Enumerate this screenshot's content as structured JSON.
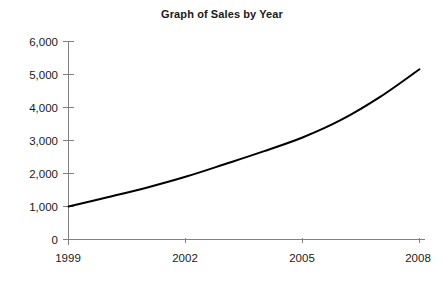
{
  "chart_data": {
    "type": "line",
    "title": "Graph of Sales by Year",
    "xlabel": "",
    "ylabel": "",
    "grid": false,
    "legend": "none",
    "x": [
      1999,
      2000,
      2001,
      2002,
      2003,
      2004,
      2005,
      2006,
      2007,
      2008
    ],
    "values": [
      1000,
      1280,
      1570,
      1900,
      2280,
      2670,
      3090,
      3630,
      4330,
      5160
    ],
    "series": [
      {
        "name": "Sales",
        "values": [
          1000,
          1280,
          1570,
          1900,
          2280,
          2670,
          3090,
          3630,
          4330,
          5160
        ],
        "color": "#000000"
      }
    ],
    "xlim": [
      1999,
      2008
    ],
    "ylim": [
      0,
      6000
    ],
    "xticks": [
      1999,
      2002,
      2005,
      2008
    ],
    "xtick_labels": [
      "1999",
      "2002",
      "2005",
      "2008"
    ],
    "yticks": [
      0,
      1000,
      2000,
      3000,
      4000,
      5000,
      6000
    ],
    "ytick_labels": [
      "0",
      "1,000",
      "2,000",
      "3,000",
      "4,000",
      "5,000",
      "6,000"
    ],
    "axis_color": "#808080",
    "curve_color": "#000000",
    "background_color": "#ffffff"
  },
  "axes": {
    "y_tick_labels": [
      "6,000",
      "5,000",
      "4,000",
      "3,000",
      "2,000",
      "1,000",
      "0"
    ],
    "x_tick_labels": [
      "1999",
      "2002",
      "2005",
      "2008"
    ]
  }
}
